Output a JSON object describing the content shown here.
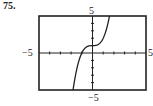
{
  "problem_number": "75.",
  "chart_data": {
    "type": "line",
    "title": "",
    "xlabel": "",
    "ylabel": "",
    "xlim": [
      -5,
      5
    ],
    "ylim": [
      -5,
      5
    ],
    "grid": false,
    "x_tick_step": 1,
    "y_tick_step": 1,
    "axis_labels": {
      "top": "5",
      "bottom": "−5",
      "left": "−5",
      "right": "5"
    },
    "series": [
      {
        "name": "f(x)",
        "description": "increasing cubic curve, y ≈ x³ + 1, inflection near (0, 1), x-intercept near −1",
        "x": [
          -1.82,
          -1.5,
          -1.0,
          -0.5,
          0,
          0.5,
          1.0,
          1.3,
          1.59
        ],
        "y": [
          -5.0,
          -2.38,
          0.0,
          0.88,
          1.0,
          1.13,
          2.0,
          3.2,
          5.0
        ]
      }
    ]
  }
}
